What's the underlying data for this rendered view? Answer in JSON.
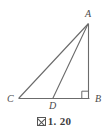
{
  "figure": {
    "caption_glyph": "▧",
    "caption_text": "1. 20",
    "background_color": "#ffffff",
    "line_color": "#6b6b6b",
    "label_color": "#4a4a4a",
    "points": [
      {
        "id": "A",
        "label": "A",
        "x": 88,
        "y": 24
      },
      {
        "id": "B",
        "label": "B",
        "x": 89,
        "y": 98
      },
      {
        "id": "C",
        "label": "C",
        "x": 19,
        "y": 98
      },
      {
        "id": "D",
        "label": "D",
        "x": 53,
        "y": 98
      }
    ],
    "segments": [
      {
        "id": "CA",
        "from": "C",
        "to": "A"
      },
      {
        "id": "AB",
        "from": "A",
        "to": "B"
      },
      {
        "id": "CB",
        "from": "C",
        "to": "B"
      },
      {
        "id": "DA",
        "from": "D",
        "to": "A"
      }
    ],
    "right_angle": {
      "at": "B",
      "size": 7
    }
  }
}
